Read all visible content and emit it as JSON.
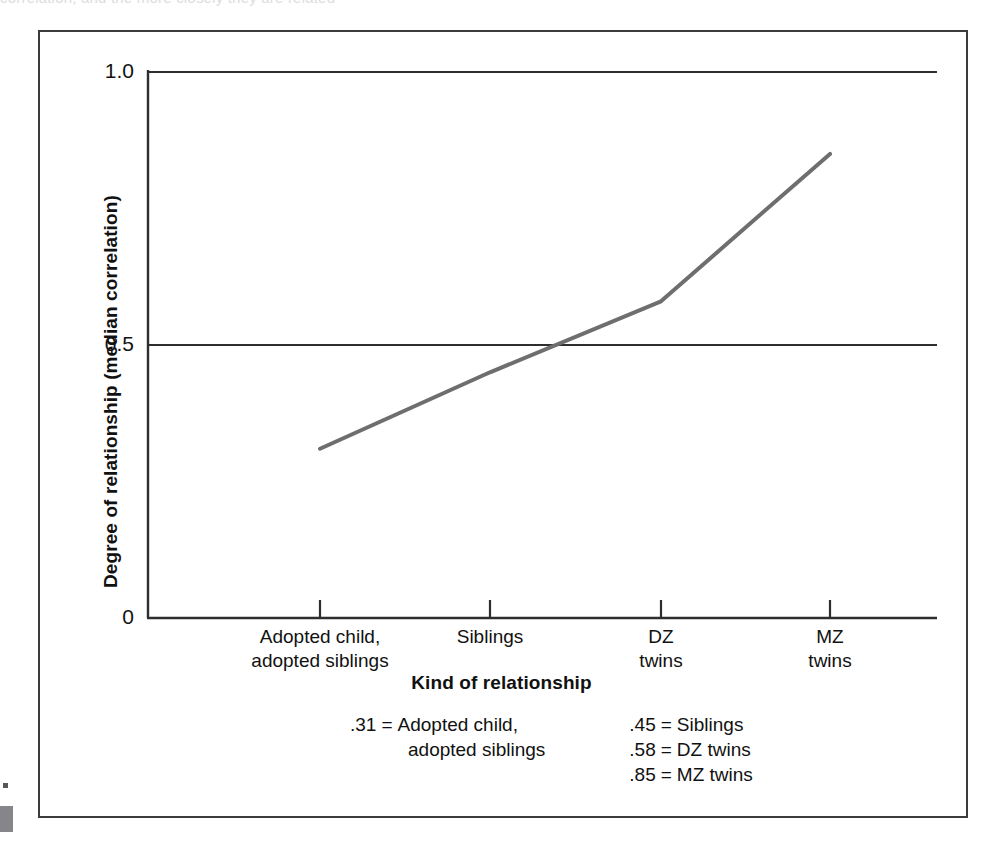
{
  "figure": {
    "top_sliver_text": "correlation, and the more closely they are related",
    "margin_mark_color": "#85858a",
    "frame_color": "#3b3b3b"
  },
  "chart_data": {
    "type": "line",
    "title": "",
    "xlabel": "Kind of relationship",
    "ylabel": "Degree of relationship (median correlation)",
    "categories": [
      "Adopted child, adopted siblings",
      "Siblings",
      "DZ twins",
      "MZ twins"
    ],
    "category_labels": [
      {
        "line1": "Adopted child,",
        "line2": "adopted siblings"
      },
      {
        "line1": "Siblings",
        "line2": ""
      },
      {
        "line1": "DZ",
        "line2": "twins"
      },
      {
        "line1": "MZ",
        "line2": "twins"
      }
    ],
    "values": [
      0.31,
      0.45,
      0.58,
      0.85
    ],
    "ylim": [
      0,
      1.0
    ],
    "ytick_labels": [
      "1.0",
      "0.5",
      "0"
    ],
    "ytick_values": [
      1.0,
      0.5,
      0
    ],
    "grid": true,
    "gridlines_at": [
      1.0,
      0.5
    ],
    "legend_position": "below-axis",
    "series_color": "#6e6e6e"
  },
  "legend": {
    "left_column": [
      {
        "value": ".31",
        "equals": "=",
        "label": "Adopted child,",
        "continuation": "adopted siblings"
      }
    ],
    "right_column": [
      {
        "value": ".45",
        "equals": "=",
        "label": "Siblings"
      },
      {
        "value": ".58",
        "equals": "=",
        "label": "DZ twins"
      },
      {
        "value": ".85",
        "equals": "=",
        "label": "MZ twins"
      }
    ]
  }
}
